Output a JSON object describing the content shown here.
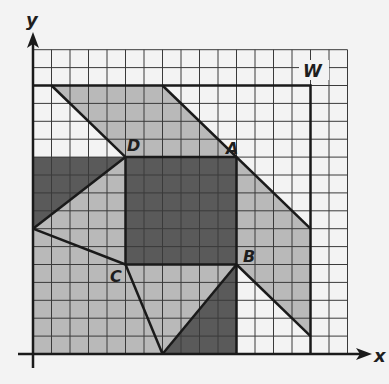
{
  "diagram": {
    "axes": {
      "x_label": "x",
      "y_label": "y",
      "grid_cells_x": 17,
      "grid_cells_y": 17
    },
    "frame": {
      "label": "W",
      "x0": 0,
      "y0": 0,
      "x1": 15,
      "y1": 15
    },
    "points": [
      {
        "label": "A",
        "x": 11,
        "y": 11
      },
      {
        "label": "B",
        "x": 11,
        "y": 5
      },
      {
        "label": "C",
        "x": 5,
        "y": 5
      },
      {
        "label": "D",
        "x": 5,
        "y": 11
      }
    ],
    "regions": [
      {
        "name": "top-parallelogram",
        "shade": "light",
        "vertices": [
          [
            1,
            15
          ],
          [
            7,
            15
          ],
          [
            11,
            11
          ],
          [
            5,
            11
          ]
        ]
      },
      {
        "name": "right-strip",
        "shade": "light",
        "vertices": [
          [
            11,
            11
          ],
          [
            15,
            7
          ],
          [
            15,
            1
          ],
          [
            11,
            5
          ]
        ]
      },
      {
        "name": "center-square",
        "shade": "dark",
        "vertices": [
          [
            5,
            11
          ],
          [
            11,
            11
          ],
          [
            11,
            5
          ],
          [
            5,
            5
          ]
        ]
      },
      {
        "name": "left-dark-triangle",
        "shade": "dark",
        "vertices": [
          [
            0,
            11
          ],
          [
            5,
            11
          ],
          [
            0,
            7
          ]
        ]
      },
      {
        "name": "left-light-triangle",
        "shade": "light",
        "vertices": [
          [
            5,
            11
          ],
          [
            0,
            7
          ],
          [
            5,
            5
          ]
        ]
      },
      {
        "name": "bottom-left-region",
        "shade": "light",
        "vertices": [
          [
            0,
            7
          ],
          [
            5,
            5
          ],
          [
            7,
            0
          ],
          [
            0,
            0
          ]
        ]
      },
      {
        "name": "bottom-middle-triangle",
        "shade": "light",
        "vertices": [
          [
            5,
            5
          ],
          [
            11,
            5
          ],
          [
            7,
            0
          ]
        ]
      },
      {
        "name": "bottom-dark-triangle",
        "shade": "dark",
        "vertices": [
          [
            7,
            0
          ],
          [
            11,
            5
          ],
          [
            11,
            0
          ]
        ]
      }
    ],
    "colors": {
      "background": "#f3f3f3",
      "light": "#b9b9b9",
      "dark": "#5a5a5a",
      "grid": "#3a3a3a",
      "stroke": "#1a1a1a"
    }
  }
}
